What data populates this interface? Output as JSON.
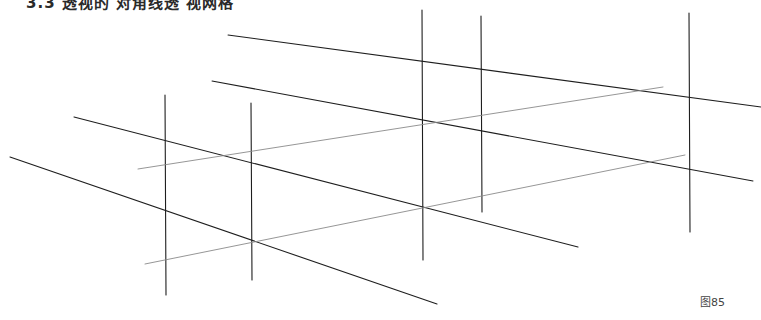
{
  "header": {
    "text": "3.3 透视的 对角线透 视网格"
  },
  "figure": {
    "label": "图85",
    "colors": {
      "dark_line": "#1e1e1e",
      "light_line": "#8a8a8a",
      "background": "#ffffff"
    },
    "vertical_lines": [
      {
        "x": 165,
        "y1": 95,
        "y2": 295
      },
      {
        "x": 251,
        "y1": 103,
        "y2": 280
      },
      {
        "x": 422,
        "y1": 10,
        "y2": 260
      },
      {
        "x": 481,
        "y1": 16,
        "y2": 212
      },
      {
        "x": 689,
        "y1": 13,
        "y2": 232
      }
    ],
    "dark_diagonals": [
      {
        "x1": 228,
        "y1": 35,
        "x2": 761,
        "y2": 107
      },
      {
        "x1": 212,
        "y1": 81,
        "x2": 753,
        "y2": 181
      },
      {
        "x1": 74,
        "y1": 117,
        "x2": 578,
        "y2": 247
      },
      {
        "x1": 10,
        "y1": 157,
        "x2": 437,
        "y2": 304
      }
    ],
    "light_diagonals": [
      {
        "x1": 138,
        "y1": 169,
        "x2": 663,
        "y2": 87
      },
      {
        "x1": 145,
        "y1": 264,
        "x2": 685,
        "y2": 155
      }
    ]
  }
}
